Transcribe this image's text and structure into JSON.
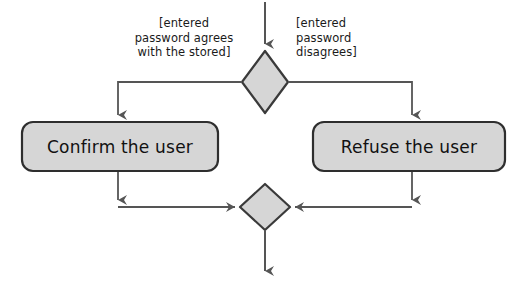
{
  "diagram": {
    "type": "uml-activity-diagram",
    "title": "",
    "colors": {
      "node_fill": "#d6d6d6",
      "node_border": "#3a3a3a",
      "edge": "#555555",
      "text": "#111111",
      "background": "#ffffff"
    },
    "nodes": [
      {
        "id": "decision-top",
        "kind": "decision-diamond",
        "label": "",
        "center": [
          265,
          82
        ]
      },
      {
        "id": "action-confirm",
        "kind": "action-rounded-rect",
        "label": "Confirm the user"
      },
      {
        "id": "action-refuse",
        "kind": "action-rounded-rect",
        "label": "Refuse the user"
      },
      {
        "id": "merge-bottom",
        "kind": "merge-diamond",
        "label": "",
        "center": [
          265,
          207
        ]
      }
    ],
    "guards": [
      {
        "id": "guard-left",
        "text": "[entered\npassword agrees\nwith the stored]",
        "attached_to": "decision-top",
        "branch": "left"
      },
      {
        "id": "guard-right",
        "text": "[entered\npassword\ndisagrees]",
        "attached_to": "decision-top",
        "branch": "right"
      }
    ],
    "edges": [
      {
        "id": "edge-start-to-decision",
        "from": "start",
        "to": "decision-top",
        "arrow": "down"
      },
      {
        "id": "edge-decision-to-confirm",
        "from": "decision-top",
        "to": "action-confirm",
        "arrow": "down"
      },
      {
        "id": "edge-decision-to-refuse",
        "from": "decision-top",
        "to": "action-refuse",
        "arrow": "down"
      },
      {
        "id": "edge-confirm-to-merge",
        "from": "action-confirm",
        "to": "merge-bottom",
        "arrow": "right"
      },
      {
        "id": "edge-refuse-to-merge",
        "from": "action-refuse",
        "to": "merge-bottom",
        "arrow": "left"
      },
      {
        "id": "edge-merge-to-end",
        "from": "merge-bottom",
        "to": "end",
        "arrow": "down"
      }
    ]
  }
}
